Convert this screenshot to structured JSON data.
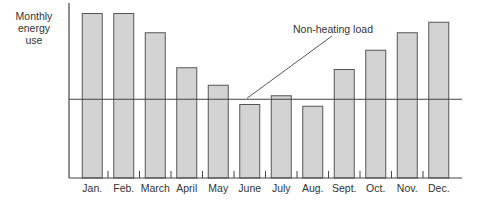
{
  "chart_data": {
    "type": "bar",
    "title": "",
    "xlabel": "",
    "ylabel": "Monthly energy use",
    "ylabel_lines": [
      "Monthly",
      "energy",
      "use"
    ],
    "categories": [
      "Jan.",
      "Feb.",
      "March",
      "April",
      "May",
      "June",
      "July",
      "Aug.",
      "Sept.",
      "Oct.",
      "Nov.",
      "Dec."
    ],
    "values": [
      94,
      94,
      83,
      63,
      53,
      42,
      47,
      41,
      62,
      73,
      83,
      89
    ],
    "value_units": "relative (no numeric axis shown)",
    "ylim": [
      0,
      100
    ],
    "reference_line": {
      "label": "Non-heating load",
      "value": 45
    },
    "grid": false,
    "legend": "none",
    "colors": {
      "bar_fill": "#d3d3d3",
      "bar_stroke": "#555555",
      "axis": "#444444"
    }
  }
}
